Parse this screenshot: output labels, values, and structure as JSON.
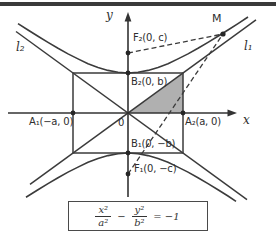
{
  "figure": {
    "axes": {
      "x_label": "x",
      "y_label": "y",
      "origin_label": "0"
    },
    "points": {
      "F2": "F₂(0, c)",
      "F1": "F₁(0, −c)",
      "B2": "B₂(0, b)",
      "B1": "B₁(0, −b)",
      "A1": "A₁(−a, 0)",
      "A2": "A₂(a, 0)",
      "M": "M"
    },
    "asymptotes": {
      "l1": "l₁",
      "l2": "l₂"
    },
    "colors": {
      "ink": "#3b3b3b",
      "shade": "#b0b0b0",
      "top_rule": "#3a3a3a"
    }
  },
  "equation": {
    "numerator1": "x²",
    "denominator1": "a²",
    "operator": "−",
    "numerator2": "y²",
    "denominator2": "b²",
    "rhs": "= −1"
  }
}
